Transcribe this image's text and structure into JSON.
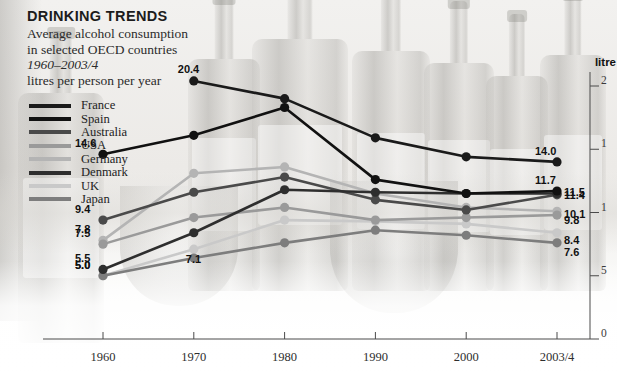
{
  "header": {
    "title": "DRINKING TRENDS",
    "subtitle_line1": "Average alcohol consumption",
    "subtitle_line2": "in selected OECD countries",
    "period": "1960–2003/4",
    "units_line": "litres per person per year"
  },
  "axis": {
    "unit_label": "litre",
    "y_ticks": [
      "2",
      "1",
      "1",
      "5",
      "0"
    ],
    "y_tick_values": [
      20,
      15,
      10,
      5,
      0
    ],
    "x_labels": [
      "1960",
      "1970",
      "1980",
      "1990",
      "2000",
      "2003/4"
    ]
  },
  "legend": {
    "items": [
      {
        "label": "France",
        "color": "#1a1a1a"
      },
      {
        "label": "Spain",
        "color": "#111111"
      },
      {
        "label": "Australia",
        "color": "#4a4a4a"
      },
      {
        "label": "USA",
        "color": "#9a9a9a"
      },
      {
        "label": "Germany",
        "color": "#b4b4b4"
      },
      {
        "label": "Denmark",
        "color": "#2e2e2e"
      },
      {
        "label": "UK",
        "color": "#c9c9c9"
      },
      {
        "label": "Japan",
        "color": "#7d7d7d"
      }
    ]
  },
  "value_labels": {
    "left": [
      "14.6",
      "9.4",
      "7.8",
      "7.5",
      "5.5",
      "5.0"
    ],
    "peak": [
      "20.4",
      "7.1"
    ],
    "right": [
      "14.0",
      "11.7",
      "11.5",
      "11.4",
      "10.1",
      "9.8",
      "8.4",
      "7.6"
    ]
  },
  "chart_data": {
    "type": "line",
    "title": "DRINKING TRENDS",
    "subtitle": "Average alcohol consumption in selected OECD countries 1960–2003/4",
    "xlabel": "",
    "ylabel": "litres per person per year",
    "ylim": [
      0,
      20
    ],
    "grid": false,
    "legend_position": "upper-left",
    "x": [
      "1960",
      "1970",
      "1980",
      "1990",
      "2000",
      "2003/4"
    ],
    "series": [
      {
        "name": "France",
        "color": "#1a1a1a",
        "values": [
          null,
          20.4,
          19.0,
          15.9,
          14.4,
          14.0
        ],
        "start_label": null,
        "end_label": "14.0"
      },
      {
        "name": "Spain",
        "color": "#111111",
        "values": [
          14.6,
          16.1,
          18.3,
          12.6,
          11.5,
          11.7
        ],
        "start_label": "14.6",
        "end_label": "11.7"
      },
      {
        "name": "Denmark",
        "color": "#2e2e2e",
        "values": [
          5.5,
          8.4,
          11.8,
          11.6,
          11.5,
          11.5
        ],
        "start_label": "5.5",
        "end_label": "11.5"
      },
      {
        "name": "Australia",
        "color": "#4a4a4a",
        "values": [
          9.4,
          11.6,
          12.8,
          11.0,
          10.2,
          11.4
        ],
        "start_label": "9.4",
        "end_label": "11.4"
      },
      {
        "name": "Germany",
        "color": "#b4b4b4",
        "values": [
          7.8,
          13.1,
          13.6,
          11.5,
          10.4,
          10.1
        ],
        "start_label": "7.8",
        "end_label": "10.1"
      },
      {
        "name": "USA",
        "color": "#9a9a9a",
        "values": [
          7.5,
          9.6,
          10.4,
          9.4,
          9.6,
          9.8
        ],
        "start_label": "7.5",
        "end_label": "9.8"
      },
      {
        "name": "UK",
        "color": "#c9c9c9",
        "values": [
          5.0,
          7.1,
          9.4,
          9.3,
          9.1,
          8.4
        ],
        "start_label": "5.0",
        "end_label": "8.4"
      },
      {
        "name": "Japan",
        "color": "#7d7d7d",
        "values": [
          5.0,
          6.4,
          7.6,
          8.6,
          8.2,
          7.6
        ],
        "start_label": "5.0",
        "end_label": "7.6"
      }
    ]
  }
}
